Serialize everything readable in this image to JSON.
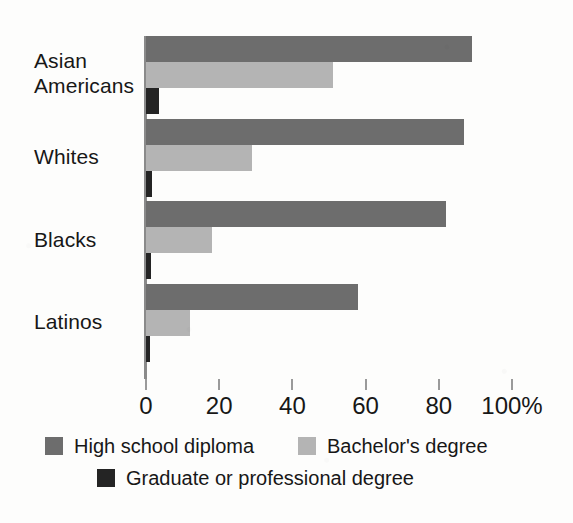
{
  "chart_data": {
    "type": "bar",
    "orientation": "horizontal",
    "title": "",
    "subtitle": "",
    "xlabel": "",
    "ylabel": "",
    "xlim": [
      0,
      100
    ],
    "x_ticks": [
      0,
      20,
      40,
      60,
      80,
      100
    ],
    "x_tick_labels": [
      "0",
      "20",
      "40",
      "60",
      "80",
      "100%"
    ],
    "grid": false,
    "legend_position": "bottom",
    "categories": [
      "Asian Americans",
      "Whites",
      "Blacks",
      "Latinos"
    ],
    "series": [
      {
        "name": "High school diploma",
        "color": "#6d6d6d",
        "values": [
          89,
          87,
          82,
          58
        ]
      },
      {
        "name": "Bachelor's degree",
        "color": "#b4b4b4",
        "values": [
          51,
          29,
          18,
          12
        ]
      },
      {
        "name": "Graduate or professional degree",
        "color": "#242424",
        "values": [
          3.5,
          1.6,
          1.3,
          1.0
        ]
      }
    ]
  },
  "axis": {
    "ticks": [
      {
        "value": 0,
        "label": "0"
      },
      {
        "value": 20,
        "label": "20"
      },
      {
        "value": 40,
        "label": "40"
      },
      {
        "value": 60,
        "label": "60"
      },
      {
        "value": 80,
        "label": "80"
      },
      {
        "value": 100,
        "label": "100%"
      }
    ]
  },
  "categories": [
    {
      "label": "Asian\nAmericans",
      "top": 48
    },
    {
      "label": "Whites",
      "top": 144
    },
    {
      "label": "Blacks",
      "top": 227
    },
    {
      "label": "Latinos",
      "top": 309
    }
  ],
  "legend": {
    "entries": [
      {
        "id": "hs",
        "label": "High school diploma",
        "color": "#6d6d6d"
      },
      {
        "id": "ba",
        "label": "Bachelor's degree",
        "color": "#b4b4b4"
      },
      {
        "id": "grad",
        "label": "Graduate or professional degree",
        "color": "#242424"
      }
    ]
  },
  "colors": {
    "high_school": "#6d6d6d",
    "bachelors": "#b4b4b4",
    "graduate": "#242424",
    "axis": "#8a8a8a",
    "text": "#171717",
    "background": "#fdfdfc"
  }
}
